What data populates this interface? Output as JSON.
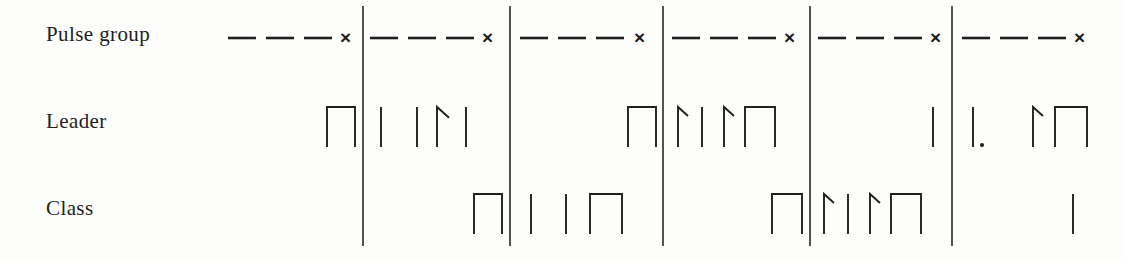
{
  "figure": {
    "background_color": "#fdfdfc",
    "ink_color": "#231f1e",
    "width": 1126,
    "height": 262
  },
  "rows": [
    {
      "id": "pulse-group",
      "label": "Pulse group",
      "label_x": 46,
      "label_y": 22,
      "baseline_y": 38
    },
    {
      "id": "leader",
      "label": "Leader",
      "label_x": 46,
      "label_y": 109,
      "baseline_y": 147
    },
    {
      "id": "class",
      "label": "Class",
      "label_x": 46,
      "label_y": 196,
      "baseline_y": 234
    }
  ],
  "dividers": {
    "name": "segment-divider",
    "x_positions": [
      363,
      510,
      663,
      810,
      952
    ],
    "y_top": 6,
    "y_bottom": 246,
    "stroke_width": 1.6,
    "color": "#2a2624"
  },
  "terminator_symbol": "×",
  "segments": [
    {
      "index": 1,
      "x_start": 228,
      "x_end": 357,
      "pulse_group": {
        "dash_segments": [
          [
            228,
            256
          ],
          [
            266,
            294
          ],
          [
            304,
            332
          ]
        ],
        "terminator_x": 340,
        "terminator_y": 28
      },
      "leader_pulses": [
        {
          "type": "square",
          "x": 327,
          "width": 28,
          "height": 40
        }
      ],
      "class_pulses": []
    },
    {
      "index": 2,
      "x_start": 370,
      "x_end": 504,
      "pulse_group": {
        "dash_segments": [
          [
            370,
            398
          ],
          [
            408,
            436
          ],
          [
            446,
            474
          ]
        ],
        "terminator_x": 482,
        "terminator_y": 28
      },
      "leader_pulses": [
        {
          "type": "bar",
          "x": 381,
          "height": 40
        },
        {
          "type": "bar",
          "x": 417,
          "height": 40
        },
        {
          "type": "hook",
          "x": 437,
          "height": 40,
          "hook_width": 12
        },
        {
          "type": "bar",
          "x": 466,
          "height": 40
        }
      ],
      "class_pulses": [
        {
          "type": "square",
          "x": 474,
          "width": 28,
          "height": 40
        }
      ]
    },
    {
      "index": 3,
      "x_start": 520,
      "x_end": 657,
      "pulse_group": {
        "dash_segments": [
          [
            520,
            548
          ],
          [
            558,
            586
          ],
          [
            596,
            624
          ]
        ],
        "terminator_x": 634,
        "terminator_y": 28
      },
      "leader_pulses": [
        {
          "type": "square",
          "x": 628,
          "width": 28,
          "height": 40
        }
      ],
      "class_pulses": [
        {
          "type": "bar",
          "x": 531,
          "height": 40
        },
        {
          "type": "bar",
          "x": 566,
          "height": 40
        },
        {
          "type": "square",
          "x": 590,
          "width": 32,
          "height": 40
        }
      ]
    },
    {
      "index": 4,
      "x_start": 672,
      "x_end": 804,
      "pulse_group": {
        "dash_segments": [
          [
            672,
            700
          ],
          [
            710,
            738
          ],
          [
            748,
            776
          ]
        ],
        "terminator_x": 784,
        "terminator_y": 28
      },
      "leader_pulses": [
        {
          "type": "hook",
          "x": 678,
          "height": 40,
          "hook_width": 10
        },
        {
          "type": "bar",
          "x": 702,
          "height": 40
        },
        {
          "type": "hook",
          "x": 724,
          "height": 40,
          "hook_width": 10
        },
        {
          "type": "square",
          "x": 745,
          "width": 30,
          "height": 40
        }
      ],
      "class_pulses": [
        {
          "type": "square",
          "x": 772,
          "width": 30,
          "height": 40
        }
      ]
    },
    {
      "index": 5,
      "x_start": 818,
      "x_end": 946,
      "pulse_group": {
        "dash_segments": [
          [
            818,
            846
          ],
          [
            856,
            884
          ],
          [
            894,
            922
          ]
        ],
        "terminator_x": 930,
        "terminator_y": 28
      },
      "leader_pulses": [
        {
          "type": "bar",
          "x": 933,
          "height": 40
        }
      ],
      "class_pulses": [
        {
          "type": "hook",
          "x": 824,
          "height": 40,
          "hook_width": 10
        },
        {
          "type": "bar",
          "x": 848,
          "height": 40
        },
        {
          "type": "hook",
          "x": 870,
          "height": 40,
          "hook_width": 10
        },
        {
          "type": "square",
          "x": 891,
          "width": 30,
          "height": 40
        }
      ]
    },
    {
      "index": 6,
      "x_start": 962,
      "x_end": 1100,
      "pulse_group": {
        "dash_segments": [
          [
            962,
            990
          ],
          [
            1000,
            1028
          ],
          [
            1038,
            1066
          ]
        ],
        "terminator_x": 1074,
        "terminator_y": 28
      },
      "leader_pulses": [
        {
          "type": "bar-dot",
          "x": 973,
          "height": 40
        },
        {
          "type": "hook",
          "x": 1033,
          "height": 40,
          "hook_width": 10
        },
        {
          "type": "square",
          "x": 1055,
          "width": 32,
          "height": 40
        }
      ],
      "class_pulses": [
        {
          "type": "bar",
          "x": 1073,
          "height": 40
        }
      ]
    }
  ]
}
